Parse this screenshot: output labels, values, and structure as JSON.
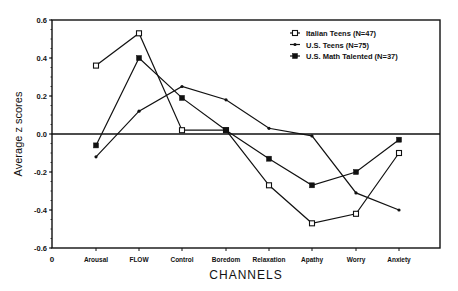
{
  "chart_data": {
    "type": "line",
    "title": "",
    "xlabel": "CHANNELS",
    "ylabel": "Average z scores",
    "ylim": [
      -0.6,
      0.6
    ],
    "yticks": [
      "0.6",
      "0.4",
      "0.2",
      "0.0",
      "-0.2",
      "-0.4",
      "-0.6"
    ],
    "x_origin_label": "0",
    "grid": false,
    "legend_position": "upper right",
    "categories": [
      "Arousal",
      "FLOW",
      "Control",
      "Boredom",
      "Relaxation",
      "Apathy",
      "Worry",
      "Anxiety"
    ],
    "series": [
      {
        "name": "Italian Teens (N=47)",
        "marker": "open-square",
        "values": [
          0.36,
          0.53,
          0.02,
          0.02,
          -0.27,
          -0.47,
          -0.42,
          -0.1
        ]
      },
      {
        "name": "U.S. Teens (N=75)",
        "marker": "small-dot",
        "values": [
          -0.12,
          0.12,
          0.25,
          0.18,
          0.03,
          -0.01,
          -0.31,
          -0.4
        ]
      },
      {
        "name": "U.S. Math Talented (N=37)",
        "marker": "filled-square",
        "values": [
          -0.06,
          0.4,
          0.19,
          0.02,
          -0.13,
          -0.27,
          -0.2,
          -0.03
        ]
      }
    ]
  }
}
